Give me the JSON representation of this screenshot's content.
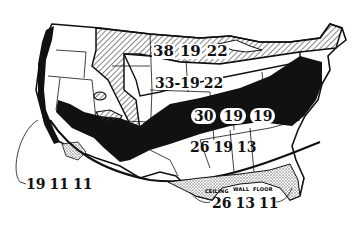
{
  "map": {
    "subject": "United States insulation zones",
    "column_headings": [
      "CEILING",
      "WALL",
      "FLOOR"
    ],
    "zones": [
      {
        "id": "north",
        "ceiling": "38",
        "wall": "19",
        "floor": "22"
      },
      {
        "id": "upper-mid",
        "ceiling": "33-19",
        "wall": "22",
        "floor": ""
      },
      {
        "id": "central-band",
        "ceiling": "30",
        "wall": "19",
        "floor": "19"
      },
      {
        "id": "south-central",
        "ceiling": "26",
        "wall": "19",
        "floor": "13"
      },
      {
        "id": "west-coast",
        "ceiling": "19",
        "wall": "11",
        "floor": "11"
      },
      {
        "id": "gulf-coast",
        "ceiling": "26",
        "wall": "13",
        "floor": "11"
      }
    ],
    "colors": {
      "ink": "#111111",
      "paper": "#ffffff",
      "hatch": "#555555",
      "stipple": "#888888"
    }
  }
}
